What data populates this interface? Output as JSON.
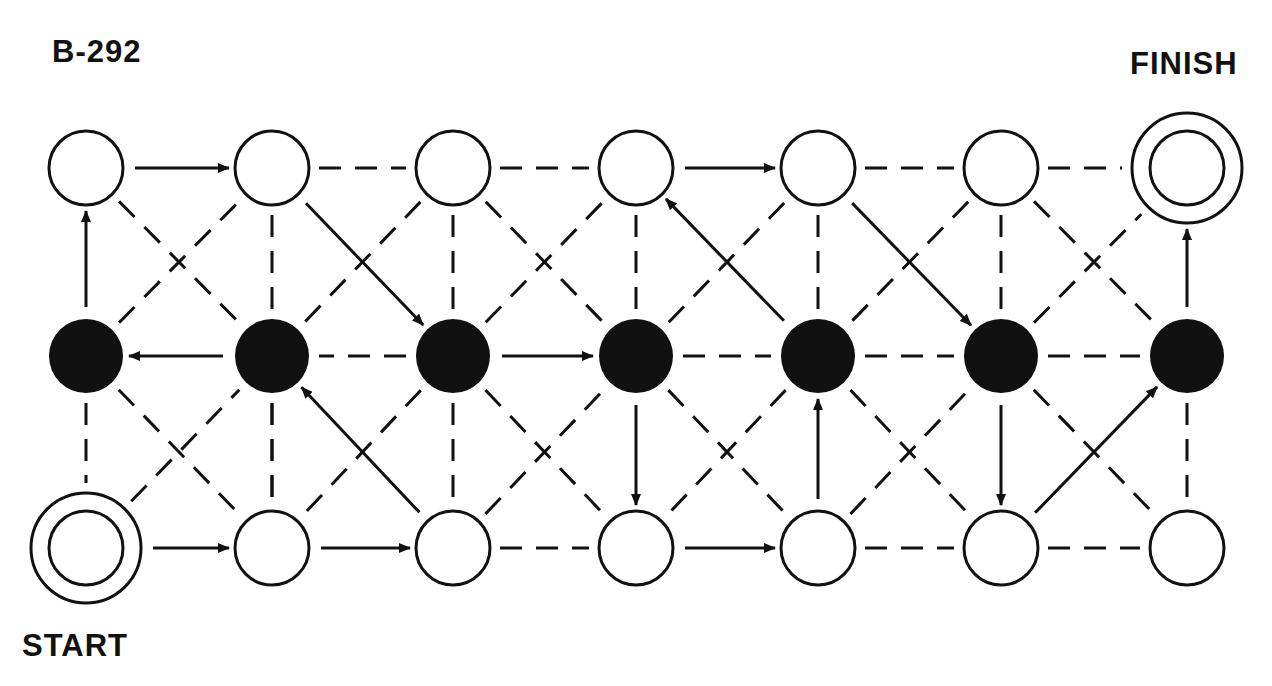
{
  "title": "B-292",
  "start_label": "START",
  "finish_label": "FINISH",
  "colors": {
    "ink": "#111111",
    "background": "#ffffff"
  },
  "columns_x": [
    86,
    272,
    453,
    636,
    818,
    1001,
    1187
  ],
  "rows_y": {
    "T": 168,
    "M": 356,
    "B": 548
  },
  "node_radius": 37,
  "nodes": [
    {
      "id": "T0",
      "row": "T",
      "col": 0,
      "type": "open"
    },
    {
      "id": "T1",
      "row": "T",
      "col": 1,
      "type": "open"
    },
    {
      "id": "T2",
      "row": "T",
      "col": 2,
      "type": "open"
    },
    {
      "id": "T3",
      "row": "T",
      "col": 3,
      "type": "open"
    },
    {
      "id": "T4",
      "row": "T",
      "col": 4,
      "type": "open"
    },
    {
      "id": "T5",
      "row": "T",
      "col": 5,
      "type": "open"
    },
    {
      "id": "T6",
      "row": "T",
      "col": 6,
      "type": "finish"
    },
    {
      "id": "M0",
      "row": "M",
      "col": 0,
      "type": "filled"
    },
    {
      "id": "M1",
      "row": "M",
      "col": 1,
      "type": "filled"
    },
    {
      "id": "M2",
      "row": "M",
      "col": 2,
      "type": "filled"
    },
    {
      "id": "M3",
      "row": "M",
      "col": 3,
      "type": "filled"
    },
    {
      "id": "M4",
      "row": "M",
      "col": 4,
      "type": "filled"
    },
    {
      "id": "M5",
      "row": "M",
      "col": 5,
      "type": "filled"
    },
    {
      "id": "M6",
      "row": "M",
      "col": 6,
      "type": "filled"
    },
    {
      "id": "B0",
      "row": "B",
      "col": 0,
      "type": "start"
    },
    {
      "id": "B1",
      "row": "B",
      "col": 1,
      "type": "open"
    },
    {
      "id": "B2",
      "row": "B",
      "col": 2,
      "type": "open"
    },
    {
      "id": "B3",
      "row": "B",
      "col": 3,
      "type": "open"
    },
    {
      "id": "B4",
      "row": "B",
      "col": 4,
      "type": "open"
    },
    {
      "id": "B5",
      "row": "B",
      "col": 5,
      "type": "open"
    },
    {
      "id": "B6",
      "row": "B",
      "col": 6,
      "type": "open"
    }
  ],
  "arrows": [
    [
      "B0",
      "B1"
    ],
    [
      "B1",
      "B2"
    ],
    [
      "B3",
      "B4"
    ],
    [
      "T0",
      "T1"
    ],
    [
      "T3",
      "T4"
    ],
    [
      "M0",
      "T0"
    ],
    [
      "M1",
      "M0"
    ],
    [
      "T1",
      "M2"
    ],
    [
      "B2",
      "M1"
    ],
    [
      "M2",
      "M3"
    ],
    [
      "M3",
      "B3"
    ],
    [
      "M4",
      "T3"
    ],
    [
      "B4",
      "M4"
    ],
    [
      "T4",
      "M5"
    ],
    [
      "M5",
      "B5"
    ],
    [
      "B5",
      "M6"
    ],
    [
      "M6",
      "T6"
    ]
  ],
  "dashed": [
    [
      "T1",
      "T2"
    ],
    [
      "T2",
      "T3"
    ],
    [
      "T4",
      "T5"
    ],
    [
      "T5",
      "T6"
    ],
    [
      "M2",
      "M1"
    ],
    [
      "M3",
      "M4"
    ],
    [
      "M4",
      "M5"
    ],
    [
      "M5",
      "M6"
    ],
    [
      "B2",
      "B3"
    ],
    [
      "B4",
      "B5"
    ],
    [
      "B5",
      "B6"
    ],
    [
      "T1",
      "M1"
    ],
    [
      "T2",
      "M2"
    ],
    [
      "T3",
      "M3"
    ],
    [
      "T4",
      "M4"
    ],
    [
      "T5",
      "M5"
    ],
    [
      "M0",
      "B0"
    ],
    [
      "M1",
      "B1"
    ],
    [
      "M2",
      "B2"
    ],
    [
      "M6",
      "B6"
    ],
    [
      "T0",
      "M1"
    ],
    [
      "M0",
      "T1"
    ],
    [
      "T2",
      "M1"
    ],
    [
      "T2",
      "M3"
    ],
    [
      "M2",
      "T3"
    ],
    [
      "M3",
      "T4"
    ],
    [
      "T5",
      "M4"
    ],
    [
      "T5",
      "M6"
    ],
    [
      "M5",
      "T6"
    ],
    [
      "M0",
      "B1"
    ],
    [
      "B0",
      "M1"
    ],
    [
      "M1",
      "B1"
    ],
    [
      "M2",
      "B1"
    ],
    [
      "M2",
      "B3"
    ],
    [
      "B2",
      "M3"
    ],
    [
      "M3",
      "B4"
    ],
    [
      "M4",
      "B3"
    ],
    [
      "M4",
      "B5"
    ],
    [
      "B4",
      "M5"
    ],
    [
      "M5",
      "B6"
    ]
  ]
}
